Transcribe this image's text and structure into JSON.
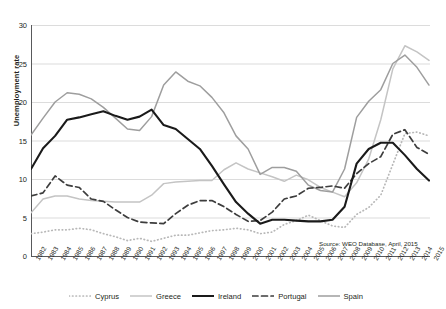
{
  "chart_data": {
    "type": "line",
    "title": "",
    "xlabel": "",
    "ylabel": "Unemployment rate",
    "ylim": [
      0,
      30
    ],
    "yticks": [
      0,
      5,
      10,
      15,
      20,
      25,
      30
    ],
    "grid": true,
    "legend_position": "bottom",
    "source": "Source: WEO Database, April, 2015",
    "x": [
      1982,
      1983,
      1984,
      1985,
      1986,
      1987,
      1988,
      1989,
      1990,
      1991,
      1992,
      1993,
      1994,
      1995,
      1996,
      1997,
      1998,
      1999,
      2000,
      2001,
      2002,
      2003,
      2004,
      2005,
      2006,
      2007,
      2008,
      2009,
      2010,
      2011,
      2012,
      2013,
      2014,
      2015
    ],
    "categories": [
      "1982",
      "1983",
      "1984",
      "1985",
      "1986",
      "1987",
      "1988",
      "1989",
      "1990",
      "1991",
      "1992",
      "1993",
      "1994",
      "1995",
      "1996",
      "1997",
      "1998",
      "1999",
      "2000",
      "2001",
      "2002",
      "2003",
      "2004",
      "2005",
      "2006",
      "2007",
      "2008",
      "2009",
      "2010",
      "2011",
      "2012",
      "2013",
      "2014",
      "2015"
    ],
    "series": [
      {
        "name": "Cyprus",
        "color": "#b8b8b8",
        "style": "dotted",
        "values": [
          2.9,
          3.1,
          3.4,
          3.4,
          3.6,
          3.4,
          2.9,
          2.5,
          2.0,
          2.3,
          1.9,
          2.3,
          2.7,
          2.7,
          3.0,
          3.3,
          3.4,
          3.6,
          3.4,
          2.9,
          3.1,
          4.1,
          4.6,
          5.3,
          4.6,
          3.9,
          3.7,
          5.4,
          6.3,
          7.9,
          11.9,
          15.9,
          16.1,
          15.6
        ]
      },
      {
        "name": "Greece",
        "color": "#c4c4c4",
        "style": "solid",
        "values": [
          5.6,
          7.4,
          7.8,
          7.8,
          7.4,
          7.2,
          7.1,
          7.0,
          7.0,
          7.0,
          7.9,
          9.4,
          9.6,
          9.7,
          9.8,
          9.8,
          11.2,
          12.1,
          11.3,
          10.8,
          10.3,
          9.7,
          10.5,
          9.9,
          8.9,
          8.3,
          7.7,
          9.5,
          12.6,
          17.7,
          24.3,
          27.3,
          26.5,
          25.4
        ]
      },
      {
        "name": "Ireland",
        "color": "#1a1a1a",
        "style": "solid",
        "values": [
          11.3,
          14.0,
          15.6,
          17.7,
          18.0,
          18.4,
          18.8,
          18.2,
          17.7,
          18.1,
          19.0,
          17.0,
          16.5,
          15.2,
          13.9,
          11.7,
          9.3,
          7.0,
          5.5,
          4.2,
          4.7,
          4.7,
          4.6,
          4.5,
          4.5,
          4.7,
          6.4,
          12.0,
          13.9,
          14.7,
          14.7,
          13.1,
          11.3,
          9.8
        ]
      },
      {
        "name": "Portugal",
        "color": "#3d3d3d",
        "style": "dashed",
        "values": [
          7.8,
          8.2,
          10.4,
          9.2,
          8.9,
          7.4,
          7.1,
          6.0,
          5.0,
          4.4,
          4.3,
          4.2,
          5.5,
          6.6,
          7.2,
          7.2,
          6.4,
          5.4,
          4.5,
          4.6,
          5.7,
          7.4,
          7.8,
          8.8,
          8.9,
          9.1,
          8.8,
          10.7,
          12.0,
          12.9,
          15.8,
          16.4,
          14.1,
          13.2
        ]
      },
      {
        "name": "Spain",
        "color": "#9e9e9e",
        "style": "solid",
        "values": [
          15.7,
          17.9,
          20.0,
          21.2,
          21.0,
          20.4,
          19.3,
          17.9,
          16.5,
          16.3,
          18.1,
          22.2,
          23.9,
          22.7,
          22.1,
          20.6,
          18.6,
          15.6,
          13.9,
          10.6,
          11.5,
          11.5,
          11.0,
          9.2,
          8.5,
          8.3,
          11.3,
          18.0,
          20.1,
          21.6,
          25.0,
          26.1,
          24.5,
          22.2
        ]
      }
    ]
  }
}
